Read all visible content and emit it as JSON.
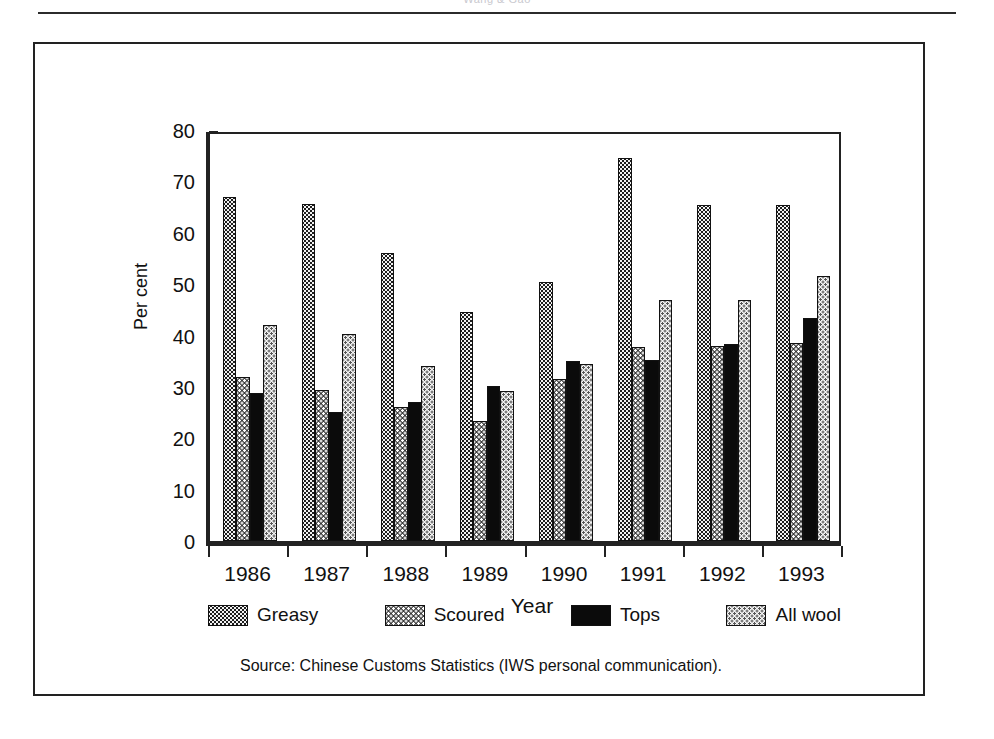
{
  "page": {
    "header_text": "Wang & Gao"
  },
  "figure": {
    "source_note": "Source: Chinese Customs Statistics (IWS personal communication)."
  },
  "legend": {
    "position": "bottom",
    "items": [
      {
        "label": "Greasy",
        "pattern": "dark-dotted",
        "color": "#1d1d1d"
      },
      {
        "label": "Scoured",
        "pattern": "mid-dotted",
        "color": "#3a3a3a"
      },
      {
        "label": "Tops",
        "pattern": "solid-black",
        "color": "#0b0b0b"
      },
      {
        "label": "All wool",
        "pattern": "light-dotted",
        "color": "#f4f4f4"
      }
    ]
  },
  "chart_data": {
    "type": "bar",
    "title": "",
    "subtitle": "",
    "xlabel": "Year",
    "ylabel": "Per cent",
    "categories": [
      "1986",
      "1987",
      "1988",
      "1989",
      "1990",
      "1991",
      "1992",
      "1993"
    ],
    "series": [
      {
        "name": "Greasy",
        "values": [
          67.0,
          65.6,
          56.0,
          44.5,
          50.5,
          74.5,
          65.5,
          65.5
        ]
      },
      {
        "name": "Scoured",
        "values": [
          32.0,
          29.3,
          26.0,
          23.3,
          31.6,
          37.7,
          38.0,
          38.5
        ]
      },
      {
        "name": "Tops",
        "values": [
          28.8,
          25.2,
          27.0,
          30.2,
          35.0,
          35.3,
          38.3,
          43.5
        ]
      },
      {
        "name": "All wool",
        "values": [
          42.0,
          40.3,
          34.0,
          29.2,
          34.5,
          47.0,
          47.0,
          51.5
        ]
      }
    ],
    "ylim": [
      0,
      80
    ],
    "yticks": [
      0,
      10,
      20,
      30,
      40,
      50,
      60,
      70,
      80
    ],
    "grid": false,
    "legend_position": "bottom"
  }
}
